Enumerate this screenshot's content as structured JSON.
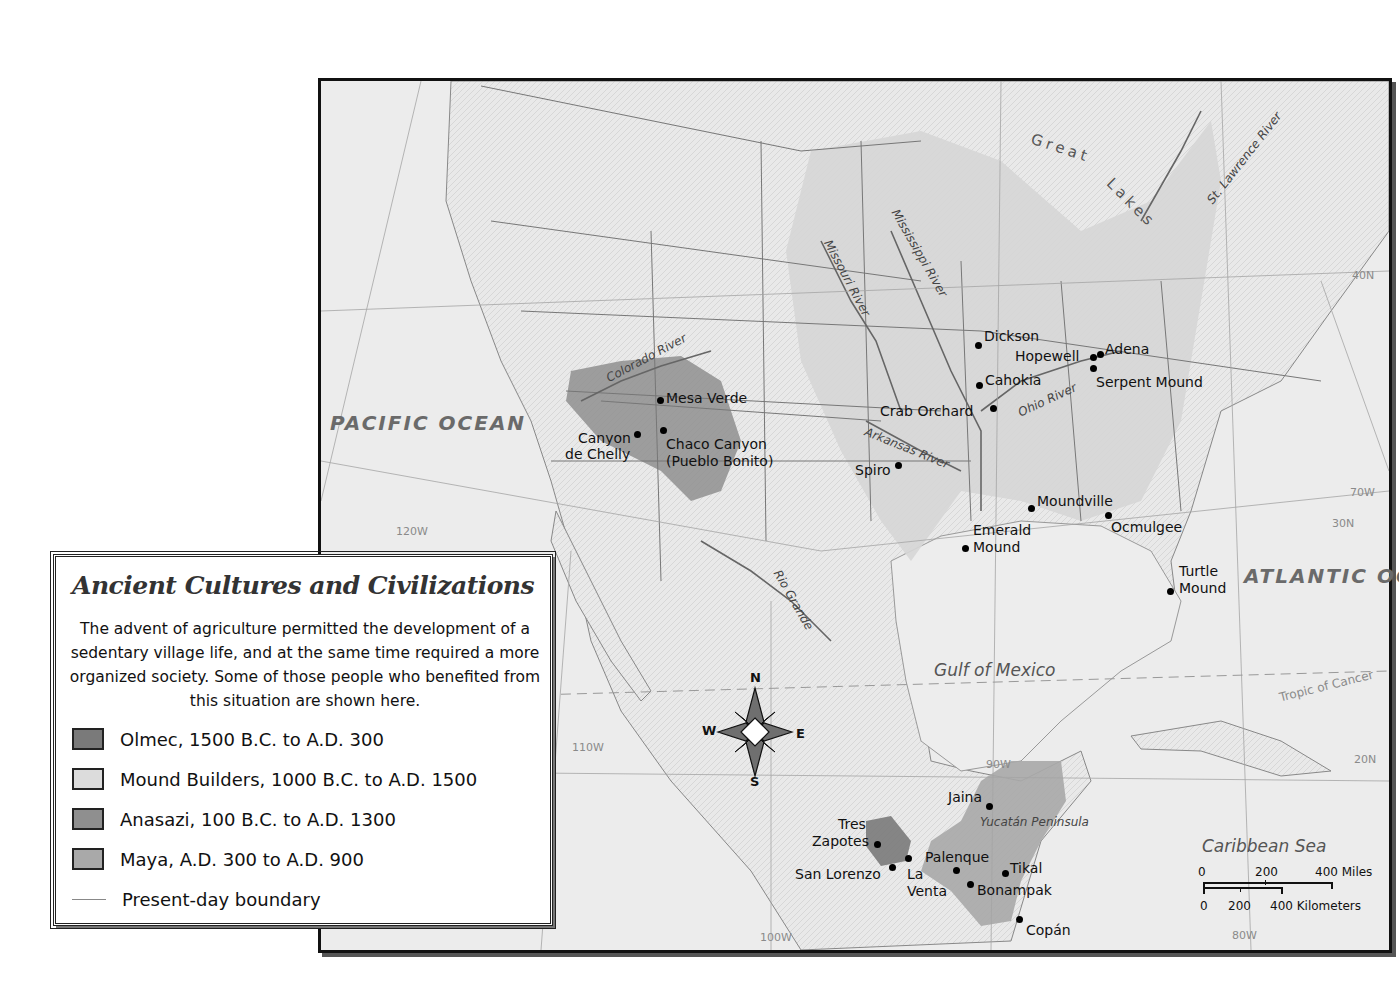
{
  "legend": {
    "title": "Ancient Cultures and Civilizations",
    "description": "The advent of agriculture permitted the development of a sedentary village life, and at the same time required a more organized society. Some of those people who benefited from this situation are shown here.",
    "items": [
      {
        "label": "Olmec, 1500 B.C. to A.D. 300",
        "color": "#7a7a7a"
      },
      {
        "label": "Mound Builders, 1000 B.C. to A.D. 1500",
        "color": "#dcdcdc"
      },
      {
        "label": "Anasazi, 100 B.C. to A.D. 1300",
        "color": "#8f8f8f"
      },
      {
        "label": "Maya, A.D. 300 to A.D. 900",
        "color": "#a9a9a9"
      },
      {
        "label": "Present-day boundary",
        "type": "line"
      }
    ]
  },
  "water_labels": {
    "pacific": "PACIFIC OCEAN",
    "atlantic": "ATLANTIC OCEAN",
    "gulf": "Gulf of Mexico",
    "caribbean": "Caribbean Sea",
    "great_lakes_1": "Great",
    "great_lakes_2": "Lakes"
  },
  "rivers": {
    "colorado": "Colorado River",
    "missouri": "Missouri River",
    "mississippi": "Mississippi River",
    "ohio": "Ohio River",
    "arkansas": "Arkansas River",
    "rio_grande": "Rio Grande",
    "st_lawrence": "St. Lawrence River"
  },
  "regions": {
    "yucatan": "Yucatán Peninsula"
  },
  "grid_labels": {
    "lat_40": "40N",
    "lat_30": "30N",
    "lat_20": "20N",
    "lon_120": "120W",
    "lon_110": "110W",
    "lon_100": "100W",
    "lon_90": "90W",
    "lon_80": "80W",
    "lon_70": "70W",
    "tropic": "Tropic of Cancer"
  },
  "sites": {
    "mesa_verde": "Mesa Verde",
    "canyon_de_chelly_1": "Canyon",
    "canyon_de_chelly_2": "de Chelly",
    "chaco_1": "Chaco Canyon",
    "chaco_2": "(Pueblo Bonito)",
    "dickson": "Dickson",
    "hopewell": "Hopewell",
    "adena": "Adena",
    "cahokia": "Cahokia",
    "serpent_mound": "Serpent Mound",
    "crab_orchard": "Crab Orchard",
    "spiro": "Spiro",
    "moundville": "Moundville",
    "ocmulgee": "Ocmulgee",
    "emerald_1": "Emerald",
    "emerald_2": "Mound",
    "turtle_1": "Turtle",
    "turtle_2": "Mound",
    "jaina": "Jaina",
    "tres_1": "Tres",
    "tres_2": "Zapotes",
    "san_lorenzo": "San Lorenzo",
    "la_venta_1": "La",
    "la_venta_2": "Venta",
    "palenque": "Palenque",
    "tikal": "Tikal",
    "bonampak": "Bonampak",
    "copan": "Copán"
  },
  "compass": {
    "n": "N",
    "s": "S",
    "e": "E",
    "w": "W"
  },
  "scale": {
    "miles_0": "0",
    "miles_200": "200",
    "miles_400": "400 Miles",
    "km_0": "0",
    "km_200": "200",
    "km_400": "400 Kilometers"
  }
}
